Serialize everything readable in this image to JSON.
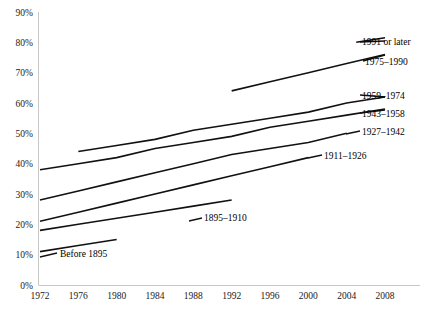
{
  "chart_data": {
    "type": "line",
    "title": "",
    "subtitle": "",
    "xlabel": "",
    "ylabel": "",
    "xlim": [
      1972,
      2008
    ],
    "ylim": [
      0,
      90
    ],
    "grid": false,
    "legend_position": "inline-right-end-labels",
    "x_ticks": [
      "1972",
      "1976",
      "1980",
      "1984",
      "1988",
      "1992",
      "1996",
      "2000",
      "2004",
      "2008"
    ],
    "y_ticks": [
      "0%",
      "10%",
      "20%",
      "30%",
      "40%",
      "50%",
      "60%",
      "70%",
      "80%",
      "90%"
    ],
    "series": [
      {
        "name": "Before 1895",
        "label": "Before 1895",
        "label_side": "right",
        "x": [
          1972,
          1976,
          1980
        ],
        "values": [
          11,
          13,
          15
        ]
      },
      {
        "name": "1895-1910",
        "label": "1895–1910",
        "label_side": "right",
        "x": [
          1972,
          1976,
          1980,
          1984,
          1988,
          1992
        ],
        "values": [
          18,
          20,
          22,
          24,
          26,
          28
        ]
      },
      {
        "name": "1911-1926",
        "label": "1911–1926",
        "label_side": "right",
        "x": [
          1972,
          1976,
          1980,
          1984,
          1988,
          1992,
          1996,
          2000
        ],
        "values": [
          21,
          24,
          27,
          30,
          33,
          36,
          39,
          42
        ]
      },
      {
        "name": "1927-1942",
        "label": "1927–1942",
        "label_side": "right",
        "x": [
          1972,
          1976,
          1980,
          1984,
          1988,
          1992,
          1996,
          2000,
          2004
        ],
        "values": [
          28,
          31,
          34,
          37,
          40,
          43,
          45,
          47,
          50
        ]
      },
      {
        "name": "1943-1958",
        "label": "1943–1958",
        "label_side": "right",
        "x": [
          1972,
          1976,
          1980,
          1984,
          1988,
          1992,
          1996,
          2000,
          2004,
          2008
        ],
        "values": [
          38,
          40,
          42,
          45,
          47,
          49,
          52,
          54,
          56,
          58
        ]
      },
      {
        "name": "1959-1974",
        "label": "1959–1974",
        "label_side": "right",
        "x": [
          1976,
          1980,
          1984,
          1988,
          1992,
          1996,
          2000,
          2004,
          2008
        ],
        "values": [
          44,
          46,
          48,
          51,
          53,
          55,
          57,
          60,
          62
        ]
      },
      {
        "name": "1975-1990",
        "label": "1975–1990",
        "label_side": "right",
        "x": [
          1992,
          1996,
          2000,
          2004,
          2008
        ],
        "values": [
          64,
          67,
          70,
          73,
          76
        ]
      },
      {
        "name": "1991 or later",
        "label": "1991 or later",
        "label_side": "right",
        "x": [
          2005,
          2006,
          2007,
          2008
        ],
        "values": [
          80,
          80.5,
          81,
          81.5
        ]
      }
    ]
  }
}
